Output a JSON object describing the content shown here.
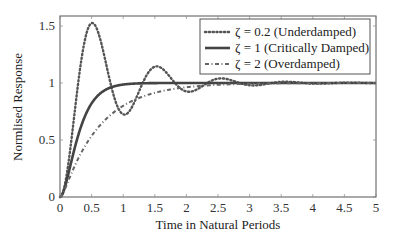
{
  "chart_data": {
    "type": "line",
    "title": "",
    "xlabel": "Time in Natural Periods",
    "ylabel": "Normlised Response",
    "xlim": [
      0,
      5
    ],
    "ylim": [
      0,
      1.6
    ],
    "xticks": [
      0,
      0.5,
      1,
      1.5,
      2,
      2.5,
      3,
      3.5,
      4,
      4.5,
      5
    ],
    "xtick_labels": [
      "0",
      "0.5",
      "1",
      "1.5",
      "2",
      "2.5",
      "3",
      "3.5",
      "4",
      "4.5",
      "5"
    ],
    "yticks": [
      0,
      0.5,
      1,
      1.5
    ],
    "ytick_labels": [
      "0",
      "0.5",
      "1",
      "1.5"
    ],
    "grid": false,
    "legend_position": "upper right",
    "x": [
      0,
      0.25,
      0.5,
      0.75,
      1,
      1.25,
      1.5,
      1.75,
      2,
      2.25,
      2.5,
      2.75,
      3,
      3.25,
      3.5,
      3.75,
      4,
      4.25,
      4.5,
      4.75,
      5
    ],
    "series": [
      {
        "name": "ζ = 0.2 (Underdamped)",
        "zeta": 0.2,
        "style": "dotted",
        "color": "#555555",
        "values": [
          0,
          0.828,
          1.526,
          1.116,
          0.725,
          0.925,
          1.143,
          1.047,
          0.926,
          0.972,
          1.038,
          1.015,
          0.979,
          0.992,
          1.011,
          1.005,
          0.994,
          0.998,
          1.003,
          1.001,
          0.998
        ]
      },
      {
        "name": "ζ = 1 (Critically Damped)",
        "zeta": 1,
        "style": "solid",
        "color": "#444444",
        "values": [
          0,
          0.465,
          0.821,
          0.949,
          0.986,
          0.997,
          0.999,
          1.0,
          1.0,
          1.0,
          1.0,
          1.0,
          1.0,
          1.0,
          1.0,
          1.0,
          1.0,
          1.0,
          1.0,
          1.0,
          1.0
        ]
      },
      {
        "name": "ζ = 2 (Overdamped)",
        "zeta": 2,
        "style": "dashdot",
        "color": "#666666",
        "values": [
          0,
          0.293,
          0.536,
          0.695,
          0.8,
          0.869,
          0.914,
          0.943,
          0.963,
          0.975,
          0.984,
          0.989,
          0.993,
          0.995,
          0.997,
          0.998,
          0.999,
          0.999,
          0.999,
          1.0,
          1.0
        ]
      }
    ]
  },
  "legend": {
    "items": [
      {
        "label": "ζ = 0.2 (Underdamped)"
      },
      {
        "label": "ζ = 1 (Critically Damped)"
      },
      {
        "label": "ζ = 2 (Overdamped)"
      }
    ]
  }
}
